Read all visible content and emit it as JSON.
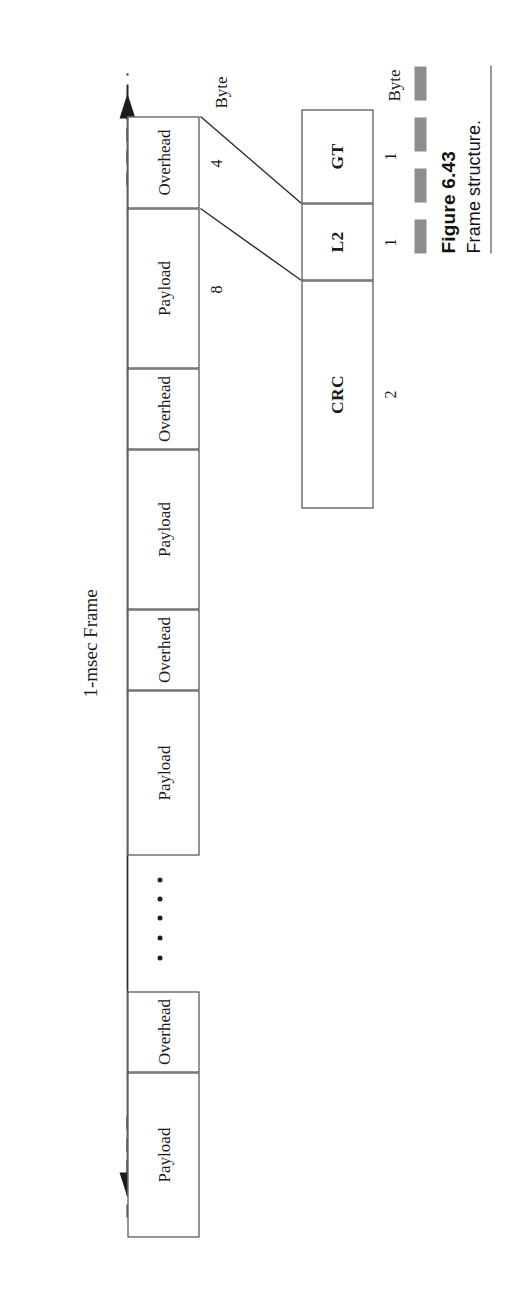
{
  "figure": {
    "number": "Figure 6.43",
    "caption": "Frame structure.",
    "frame_label": "1-msec Frame",
    "byte_axis_label_frame": "Byte",
    "byte_axis_label_detail": "Byte",
    "accent_gray": "#8e8e8e",
    "line_color": "#2b2b2b"
  },
  "frame": {
    "slots": [
      {
        "label": "Slot 1",
        "fields": [
          {
            "name": "Overhead",
            "bytes": "4"
          },
          {
            "name": "Payload",
            "bytes": "8"
          }
        ]
      },
      {
        "label": "Slot 2",
        "fields": [
          {
            "name": "Overhead",
            "bytes": ""
          },
          {
            "name": "Payload",
            "bytes": ""
          }
        ]
      },
      {
        "label": "Slot 3",
        "fields": [
          {
            "name": "Overhead",
            "bytes": ""
          },
          {
            "name": "Payload",
            "bytes": ""
          }
        ]
      },
      {
        "label": "Slot 24",
        "fields": [
          {
            "name": "Overhead",
            "bytes": ""
          },
          {
            "name": "Payload",
            "bytes": ""
          }
        ]
      }
    ],
    "ellipsis_dots": 5
  },
  "overhead_detail": {
    "fields": [
      {
        "name": "GT",
        "bytes": "1"
      },
      {
        "name": "L2",
        "bytes": "1"
      },
      {
        "name": "CRC",
        "bytes": "2"
      }
    ]
  }
}
